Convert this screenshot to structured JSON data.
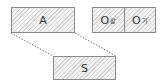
{
  "diagram": {
    "top_left_box": {
      "label": "A"
    },
    "bottom_box": {
      "label": "S"
    },
    "right_box": {
      "cells": [
        {
          "main": "O",
          "sub": "활"
        },
        {
          "main": "O",
          "sub": "기"
        }
      ]
    },
    "connector_style": "dotted",
    "colors": {
      "border": "#8a8a8a",
      "hatch": "#d6d6d6",
      "fill": "#f3f3f3"
    }
  }
}
